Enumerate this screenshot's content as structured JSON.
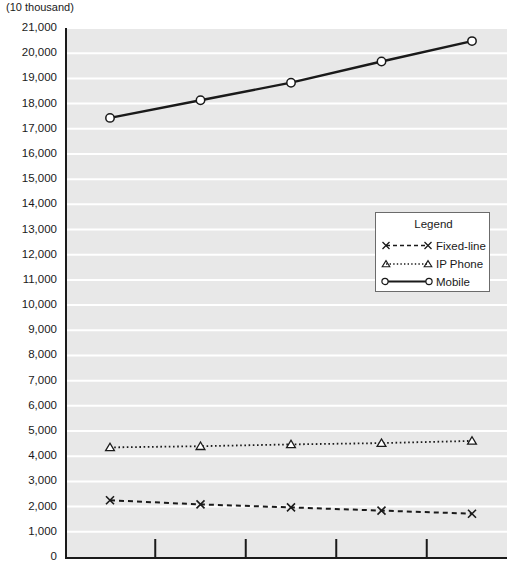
{
  "axis": {
    "unit_label": "(10 thousand)",
    "y_ticks": [
      "21,000",
      "20,000",
      "19,000",
      "18,000",
      "17,000",
      "16,000",
      "15,000",
      "14,000",
      "13,000",
      "12,000",
      "11,000",
      "10,000",
      "9,000",
      "8,000",
      "7,000",
      "6,000",
      "5,000",
      "4,000",
      "3,000",
      "2,000",
      "1,000",
      "0"
    ]
  },
  "legend": {
    "title": "Legend",
    "items": [
      {
        "label": "Fixed-line",
        "marker": "x-marker-icon",
        "line": "dashed"
      },
      {
        "label": "IP Phone",
        "marker": "triangle-marker-icon",
        "line": "dotted"
      },
      {
        "label": "Mobile",
        "marker": "circle-marker-icon",
        "line": "solid"
      }
    ]
  },
  "colors": {
    "plot_background": "#e8e8e8",
    "gridline": "#ffffff",
    "axis": "#1a1a1a",
    "series": "#1a1a1a",
    "legend_border": "#6b6b6b"
  },
  "chart_data": {
    "type": "line",
    "title": "",
    "xlabel": "",
    "ylabel": "(10 thousand)",
    "ylim": [
      0,
      21000
    ],
    "ytick_step": 1000,
    "grid": true,
    "legend_position": "center-right",
    "x": [
      1,
      2,
      3,
      4,
      5
    ],
    "xtick_labels": [
      "",
      "",
      "",
      "",
      ""
    ],
    "series": [
      {
        "name": "Fixed-line",
        "marker": "x",
        "linestyle": "dashed",
        "values": [
          2250,
          2090,
          1970,
          1840,
          1720
        ]
      },
      {
        "name": "IP Phone",
        "marker": "triangle",
        "linestyle": "dotted",
        "values": [
          4350,
          4400,
          4470,
          4520,
          4610
        ]
      },
      {
        "name": "Mobile",
        "marker": "circle",
        "linestyle": "solid",
        "values": [
          17430,
          18130,
          18830,
          19670,
          20480
        ]
      }
    ]
  }
}
